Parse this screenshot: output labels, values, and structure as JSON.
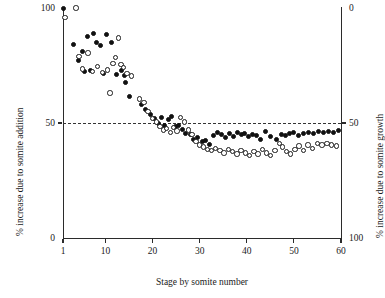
{
  "chart_data": {
    "type": "scatter",
    "title": "",
    "xlabel": "Stage by somite number",
    "ylabel": "% increase due to somite addition",
    "y2label": "% increase due to somite growth",
    "xlim": [
      1,
      60
    ],
    "ylim": [
      0,
      100
    ],
    "y2lim": [
      100,
      0
    ],
    "xticks": [
      1,
      10,
      20,
      30,
      40,
      50,
      60
    ],
    "yticks": [
      0,
      50,
      100
    ],
    "y2ticks": [
      0,
      50,
      100
    ],
    "grid": false,
    "legend": "none",
    "annotations": [
      {
        "name": "reference-line",
        "type": "hline",
        "y": 50,
        "style": "dashed"
      }
    ],
    "series": [
      {
        "name": "filled-circles",
        "marker": "filled-circle",
        "color": "#111111",
        "points": [
          [
            1.2,
            100.0
          ],
          [
            3.2,
            84.0
          ],
          [
            4.2,
            77.0
          ],
          [
            5.1,
            81.0
          ],
          [
            5.6,
            72.5
          ],
          [
            6.2,
            87.5
          ],
          [
            6.9,
            73.0
          ],
          [
            7.5,
            89.0
          ],
          [
            8.2,
            85.0
          ],
          [
            9.0,
            83.5
          ],
          [
            9.6,
            71.5
          ],
          [
            10.3,
            88.5
          ],
          [
            11.3,
            85.0
          ],
          [
            12.4,
            71.0
          ],
          [
            13.4,
            73.0
          ],
          [
            14.0,
            70.5
          ],
          [
            14.3,
            67.5
          ],
          [
            15.2,
            61.5
          ],
          [
            17.6,
            58.0
          ],
          [
            18.6,
            56.0
          ],
          [
            19.5,
            53.5
          ],
          [
            20.4,
            52.0
          ],
          [
            21.2,
            50.0
          ],
          [
            21.9,
            52.5
          ],
          [
            22.6,
            49.0
          ],
          [
            23.3,
            51.5
          ],
          [
            24.1,
            53.0
          ],
          [
            24.8,
            48.5
          ],
          [
            25.5,
            49.0
          ],
          [
            26.3,
            47.0
          ],
          [
            27.1,
            45.5
          ],
          [
            28.0,
            45.0
          ],
          [
            28.8,
            43.0
          ],
          [
            29.6,
            43.5
          ],
          [
            30.5,
            42.0
          ],
          [
            31.3,
            42.5
          ],
          [
            32.1,
            40.5
          ],
          [
            32.9,
            44.5
          ],
          [
            33.8,
            46.0
          ],
          [
            34.6,
            45.0
          ],
          [
            35.4,
            43.5
          ],
          [
            36.3,
            45.5
          ],
          [
            37.1,
            44.0
          ],
          [
            38.0,
            46.0
          ],
          [
            38.8,
            45.0
          ],
          [
            39.6,
            45.5
          ],
          [
            40.4,
            44.0
          ],
          [
            41.3,
            45.0
          ],
          [
            42.1,
            44.5
          ],
          [
            43.0,
            43.0
          ],
          [
            44.0,
            46.5
          ],
          [
            45.0,
            44.0
          ],
          [
            46.3,
            43.0
          ],
          [
            47.3,
            45.0
          ],
          [
            48.2,
            44.5
          ],
          [
            49.1,
            45.5
          ],
          [
            50.0,
            46.0
          ],
          [
            51.0,
            44.5
          ],
          [
            52.0,
            45.5
          ],
          [
            53.0,
            46.0
          ],
          [
            54.1,
            45.5
          ],
          [
            55.2,
            46.5
          ],
          [
            56.3,
            46.0
          ],
          [
            57.4,
            46.5
          ],
          [
            58.5,
            46.0
          ],
          [
            59.4,
            46.8
          ]
        ]
      },
      {
        "name": "open-circles",
        "marker": "open-circle",
        "color": "#1a1a1a",
        "points": [
          [
            1.4,
            96.0
          ],
          [
            3.8,
            100.0
          ],
          [
            4.4,
            79.0
          ],
          [
            5.2,
            73.5
          ],
          [
            6.3,
            80.5
          ],
          [
            7.2,
            72.5
          ],
          [
            8.3,
            74.5
          ],
          [
            9.4,
            72.0
          ],
          [
            10.5,
            73.0
          ],
          [
            11.6,
            76.0
          ],
          [
            12.2,
            78.5
          ],
          [
            12.8,
            87.0
          ],
          [
            13.3,
            75.5
          ],
          [
            13.9,
            74.0
          ],
          [
            14.6,
            71.5
          ],
          [
            15.6,
            70.5
          ],
          [
            11.0,
            63.0
          ],
          [
            17.3,
            60.5
          ],
          [
            18.2,
            59.0
          ],
          [
            19.0,
            55.0
          ],
          [
            20.0,
            52.0
          ],
          [
            20.8,
            50.5
          ],
          [
            21.6,
            48.5
          ],
          [
            22.3,
            47.0
          ],
          [
            23.0,
            47.5
          ],
          [
            23.8,
            46.0
          ],
          [
            24.5,
            48.0
          ],
          [
            25.2,
            46.5
          ],
          [
            26.0,
            52.5
          ],
          [
            26.8,
            50.5
          ],
          [
            27.6,
            47.0
          ],
          [
            28.4,
            45.0
          ],
          [
            29.2,
            42.0
          ],
          [
            30.0,
            40.5
          ],
          [
            30.8,
            39.5
          ],
          [
            31.7,
            38.5
          ],
          [
            32.5,
            38.0
          ],
          [
            33.4,
            39.0
          ],
          [
            34.3,
            38.0
          ],
          [
            35.2,
            37.0
          ],
          [
            36.1,
            38.5
          ],
          [
            37.0,
            37.5
          ],
          [
            37.9,
            36.5
          ],
          [
            38.8,
            38.0
          ],
          [
            39.7,
            37.0
          ],
          [
            40.6,
            36.0
          ],
          [
            41.5,
            37.5
          ],
          [
            42.4,
            36.5
          ],
          [
            43.3,
            38.5
          ],
          [
            44.2,
            37.0
          ],
          [
            45.1,
            36.0
          ],
          [
            46.0,
            38.0
          ],
          [
            46.9,
            41.0
          ],
          [
            47.6,
            39.5
          ],
          [
            48.4,
            37.5
          ],
          [
            49.3,
            36.5
          ],
          [
            50.2,
            38.5
          ],
          [
            51.1,
            40.0
          ],
          [
            52.0,
            38.0
          ],
          [
            53.0,
            40.5
          ],
          [
            54.0,
            39.0
          ],
          [
            55.0,
            41.0
          ],
          [
            56.0,
            40.5
          ],
          [
            57.0,
            41.0
          ],
          [
            58.0,
            40.5
          ],
          [
            59.0,
            40.0
          ]
        ]
      }
    ]
  }
}
